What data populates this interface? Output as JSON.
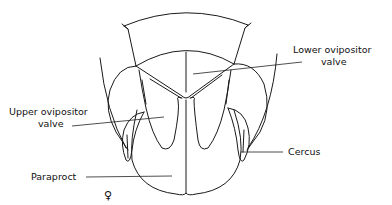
{
  "diagram": {
    "labels": {
      "lower_ovipositor_valve": [
        "Lower ovipositor",
        "valve"
      ],
      "upper_ovipositor_valve": [
        "Upper ovipositor",
        "valve"
      ],
      "cercus": "Cercus",
      "paraproct": "Paraproct"
    },
    "sex_symbol": "♀"
  }
}
